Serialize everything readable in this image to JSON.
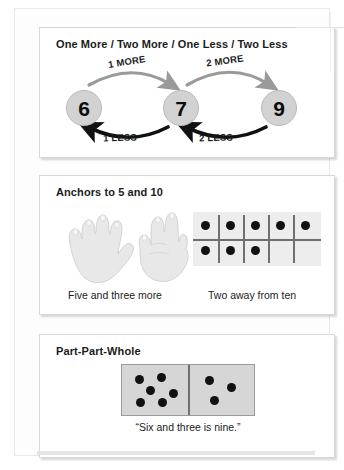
{
  "document": {
    "title": "Number Sense Strategies Reference Card"
  },
  "sections": [
    {
      "id": "one-more-two-more",
      "title": "One More / Two More / One Less / Two Less",
      "numbers": [
        {
          "value": "6"
        },
        {
          "value": "7"
        },
        {
          "value": "9"
        }
      ],
      "arrows": [
        {
          "label": "1 MORE",
          "direction": "right",
          "from": "6",
          "to": "7"
        },
        {
          "label": "2 MORE",
          "direction": "right",
          "from": "7",
          "to": "9"
        },
        {
          "label": "1 LESS",
          "direction": "left",
          "from": "7",
          "to": "6"
        },
        {
          "label": "2 LESS",
          "direction": "left",
          "from": "9",
          "to": "7"
        }
      ]
    },
    {
      "id": "anchors",
      "title": "Anchors to 5 and 10",
      "hands": {
        "caption": "Five and three more",
        "left_hand_fingers": 5,
        "right_hand_fingers": 3
      },
      "tenframe": {
        "caption": "Two away from ten",
        "columns": 5,
        "rows": 2,
        "filled": 8,
        "top_row": [
          true,
          true,
          true,
          true,
          true
        ],
        "bottom_row": [
          true,
          true,
          true,
          false,
          false
        ]
      }
    },
    {
      "id": "part-part-whole",
      "title": "Part-Part-Whole",
      "domino": {
        "caption": "“Six and three is nine.”",
        "left_dots": 6,
        "right_dots": 3,
        "total": 9
      }
    }
  ],
  "colors": {
    "page_background": "#ffffff",
    "panel_background": "#ffffff",
    "panel_border": "#d8d8d8",
    "circle_fill": "#d2d2d2",
    "dot_fill": "#111111",
    "tenframe_fill": "#ededed",
    "domino_fill": "#d6d6d6",
    "text": "#1b1b1b",
    "arrow_more": "#9a9a9a",
    "arrow_less": "#111111"
  }
}
